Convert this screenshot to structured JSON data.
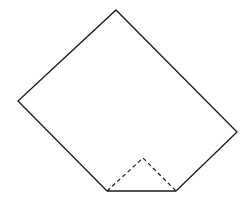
{
  "diagram": {
    "title": "",
    "colors": {
      "background": "#ffffff",
      "stroke": "#1a1a1a"
    },
    "shape": {
      "name": "folded-square-sheet",
      "outline_points": [
        [
          107,
          191
        ],
        [
          18,
          101
        ],
        [
          116,
          10
        ],
        [
          237,
          132
        ],
        [
          176,
          191
        ]
      ],
      "bottom_edge": [
        [
          107,
          191
        ],
        [
          176,
          191
        ]
      ]
    },
    "fold": {
      "name": "valley-fold-triangle",
      "style": "dashed",
      "points": [
        [
          107,
          191
        ],
        [
          143,
          158
        ],
        [
          176,
          191
        ]
      ]
    }
  }
}
